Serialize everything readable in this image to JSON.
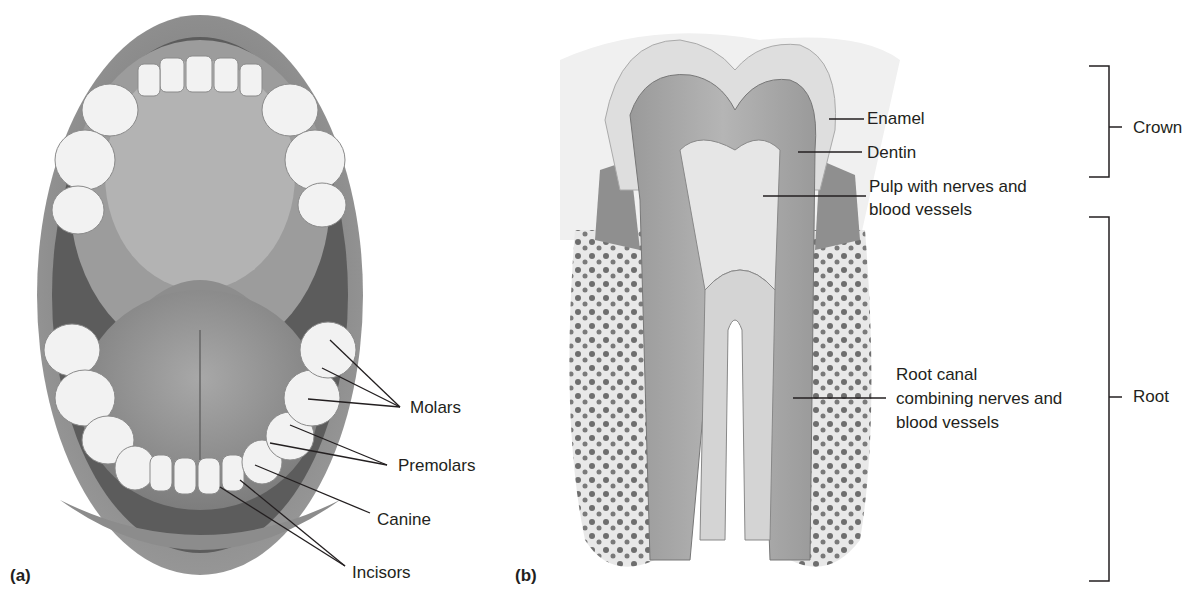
{
  "panel_a": {
    "panel_label": "(a)",
    "labels": {
      "molars": "Molars",
      "premolars": "Premolars",
      "canine": "Canine",
      "incisors": "Incisors"
    }
  },
  "panel_b": {
    "panel_label": "(b)",
    "labels": {
      "enamel": "Enamel",
      "dentin": "Dentin",
      "pulp_line1": "Pulp with nerves and",
      "pulp_line2": "blood vessels",
      "root_canal_line1": "Root canal",
      "root_canal_line2": "combining nerves and",
      "root_canal_line3": "blood vessels",
      "crown": "Crown",
      "root": "Root"
    }
  },
  "colors": {
    "text": "#231f20",
    "line": "#231f20",
    "illustration": "#8a8a8a"
  }
}
